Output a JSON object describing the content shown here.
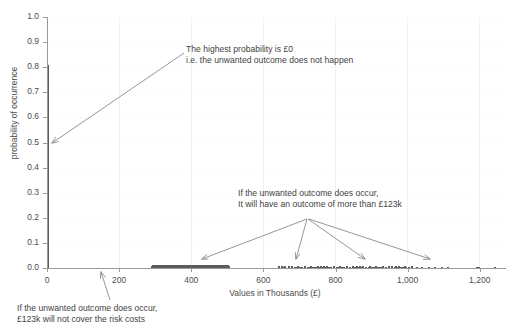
{
  "chart_data": {
    "type": "bar",
    "title": "",
    "xlabel": "Values in Thousands (£)",
    "ylabel": "probability of occurrence",
    "xlim": [
      0,
      1270
    ],
    "ylim": [
      0,
      1.0
    ],
    "grid": true,
    "legend": "none",
    "x_ticks": [
      "0",
      "200",
      "400",
      "600",
      "800",
      "1,000",
      "1,200"
    ],
    "x_tick_values": [
      0,
      200,
      400,
      600,
      800,
      1000,
      1200
    ],
    "y_ticks": [
      "0.0",
      "0.1",
      "0.2",
      "0.3",
      "0.4",
      "0.5",
      "0.6",
      "0.7",
      "0.8",
      "0.9",
      "1.0"
    ],
    "y_tick_values": [
      0.0,
      0.1,
      0.2,
      0.3,
      0.4,
      0.5,
      0.6,
      0.7,
      0.8,
      0.9,
      1.0
    ],
    "categories": [
      0,
      290,
      300,
      310,
      320,
      330,
      340,
      350,
      360,
      370,
      380,
      390,
      400,
      410,
      420,
      430,
      440,
      450,
      460,
      470,
      480,
      490,
      500,
      640,
      652,
      668,
      676,
      690,
      700,
      712,
      724,
      736,
      744,
      752,
      760,
      770,
      778,
      786,
      794,
      800,
      808,
      816,
      822,
      830,
      838,
      846,
      852,
      860,
      868,
      874,
      882,
      890,
      898,
      906,
      914,
      922,
      930,
      938,
      946,
      954,
      962,
      970,
      978,
      986,
      994,
      1002,
      1010,
      1022,
      1038,
      1056,
      1074,
      1092,
      1110,
      1190,
      1196,
      1240
    ],
    "values": [
      0.81,
      0.004,
      0.004,
      0.005,
      0.004,
      0.005,
      0.005,
      0.006,
      0.005,
      0.006,
      0.006,
      0.005,
      0.006,
      0.005,
      0.006,
      0.005,
      0.006,
      0.005,
      0.005,
      0.005,
      0.005,
      0.004,
      0.004,
      0.003,
      0.003,
      0.003,
      0.003,
      0.004,
      0.003,
      0.004,
      0.003,
      0.004,
      0.003,
      0.004,
      0.003,
      0.004,
      0.003,
      0.004,
      0.004,
      0.003,
      0.004,
      0.003,
      0.004,
      0.003,
      0.004,
      0.003,
      0.004,
      0.004,
      0.003,
      0.004,
      0.003,
      0.004,
      0.003,
      0.004,
      0.003,
      0.003,
      0.004,
      0.003,
      0.003,
      0.003,
      0.003,
      0.003,
      0.003,
      0.003,
      0.003,
      0.003,
      0.003,
      0.002,
      0.003,
      0.002,
      0.003,
      0.002,
      0.002,
      0.002,
      0.002,
      0.002
    ],
    "series_color": "#5c5c5c",
    "annotations": [
      {
        "id": "zero-probability",
        "line1": "The highest probability is £0",
        "line2": "i.e. the unwanted outcome does not happen"
      },
      {
        "id": "outcome-above-123k",
        "line1": "If the unwanted outcome does occur,",
        "line2": "It will have an outcome of more than £123k"
      },
      {
        "id": "123k-not-enough",
        "line1": "If the unwanted outcome does occur,",
        "line2": "£123k will not cover the risk costs"
      }
    ]
  }
}
